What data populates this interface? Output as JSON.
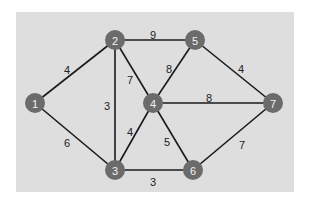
{
  "diagram": {
    "type": "weighted-undirected-graph",
    "panel_color": "#dedede",
    "node_color": "#6b6b6b",
    "edge_color": "#1a1a1a",
    "nodes": [
      {
        "id": "1",
        "label": "1",
        "x": 35,
        "y": 103
      },
      {
        "id": "2",
        "label": "2",
        "x": 115,
        "y": 40
      },
      {
        "id": "3",
        "label": "3",
        "x": 115,
        "y": 170
      },
      {
        "id": "4",
        "label": "4",
        "x": 153,
        "y": 103
      },
      {
        "id": "5",
        "label": "5",
        "x": 195,
        "y": 40
      },
      {
        "id": "6",
        "label": "6",
        "x": 193,
        "y": 170
      },
      {
        "id": "7",
        "label": "7",
        "x": 273,
        "y": 103
      }
    ],
    "edges": [
      {
        "from": "1",
        "to": "2",
        "weight": "4",
        "lx": 67,
        "ly": 70
      },
      {
        "from": "1",
        "to": "3",
        "weight": "6",
        "lx": 67,
        "ly": 143
      },
      {
        "from": "2",
        "to": "5",
        "weight": "9",
        "lx": 153,
        "ly": 35
      },
      {
        "from": "2",
        "to": "4",
        "weight": "7",
        "lx": 130,
        "ly": 80
      },
      {
        "from": "2",
        "to": "3",
        "weight": "3",
        "lx": 107,
        "ly": 106
      },
      {
        "from": "5",
        "to": "4",
        "weight": "8",
        "lx": 169,
        "ly": 69
      },
      {
        "from": "5",
        "to": "7",
        "weight": "4",
        "lx": 241,
        "ly": 69
      },
      {
        "from": "4",
        "to": "7",
        "weight": "8",
        "lx": 209,
        "ly": 98
      },
      {
        "from": "4",
        "to": "3",
        "weight": "4",
        "lx": 130,
        "ly": 132
      },
      {
        "from": "4",
        "to": "6",
        "weight": "5",
        "lx": 167,
        "ly": 142
      },
      {
        "from": "3",
        "to": "6",
        "weight": "3",
        "lx": 153,
        "ly": 182
      },
      {
        "from": "6",
        "to": "7",
        "weight": "7",
        "lx": 242,
        "ly": 145
      }
    ]
  }
}
